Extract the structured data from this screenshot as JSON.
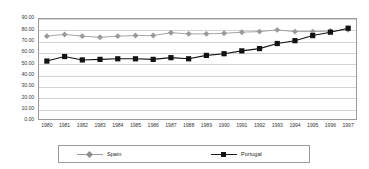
{
  "chart_data": {
    "type": "line",
    "title": "",
    "xlabel": "",
    "ylabel": "",
    "ylim": [
      0,
      90
    ],
    "ytick_step": 10,
    "grid": true,
    "legend_position": "bottom",
    "categories": [
      "1980",
      "1981",
      "1982",
      "1983",
      "1984",
      "1985",
      "1986",
      "1987",
      "1988",
      "1989",
      "1990",
      "1991",
      "1992",
      "1993",
      "1994",
      "1995",
      "1996",
      "1997"
    ],
    "ytick_labels": [
      "90.00",
      "80.00",
      "70.00",
      "60.00",
      "50.00",
      "40.00",
      "30.00",
      "20.00",
      "10.00",
      "0.00"
    ],
    "ytick_values": [
      90,
      80,
      70,
      60,
      50,
      40,
      30,
      20,
      10,
      0
    ],
    "series": [
      {
        "name": "Spain",
        "color": "#9a9a9a",
        "marker": "diamond",
        "values": [
          74.0,
          75.5,
          74.0,
          73.0,
          74.0,
          74.5,
          74.5,
          77.0,
          76.0,
          76.0,
          76.5,
          77.5,
          78.0,
          79.5,
          78.0,
          78.0,
          78.5,
          79.5
        ]
      },
      {
        "name": "Portugal",
        "color": "#121212",
        "marker": "square",
        "values": [
          52.0,
          56.0,
          53.0,
          53.5,
          54.0,
          54.0,
          53.5,
          55.0,
          54.0,
          57.0,
          58.5,
          61.0,
          63.0,
          67.5,
          70.0,
          74.5,
          77.5,
          81.0
        ]
      }
    ]
  },
  "legend": {
    "entries": [
      {
        "label": "Spain"
      },
      {
        "label": "Portugal"
      }
    ]
  }
}
